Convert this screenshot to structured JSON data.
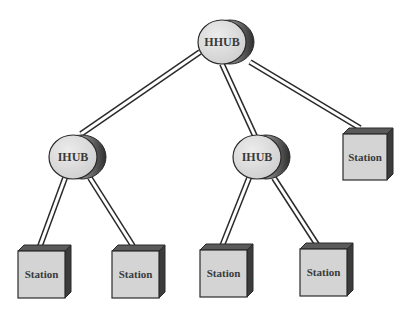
{
  "diagram": {
    "root": {
      "id": "hhub",
      "label": "HHUB",
      "type": "hub",
      "cx": 222,
      "cy": 42
    },
    "hubs": [
      {
        "id": "ihub-left",
        "label": "IHUB",
        "type": "hub",
        "cx": 73,
        "cy": 157
      },
      {
        "id": "ihub-middle",
        "label": "IHUB",
        "type": "hub",
        "cx": 257,
        "cy": 157
      }
    ],
    "stations": [
      {
        "id": "station-right",
        "label": "Station",
        "x": 343,
        "y": 128
      },
      {
        "id": "station-1",
        "label": "Station",
        "x": 18,
        "y": 248
      },
      {
        "id": "station-2",
        "label": "Station",
        "x": 112,
        "y": 248
      },
      {
        "id": "station-3",
        "label": "Station",
        "x": 200,
        "y": 248
      },
      {
        "id": "station-4",
        "label": "Station",
        "x": 300,
        "y": 248
      }
    ],
    "links": [
      {
        "from": "hhub",
        "to": "ihub-left"
      },
      {
        "from": "hhub",
        "to": "ihub-middle"
      },
      {
        "from": "hhub",
        "to": "station-right"
      },
      {
        "from": "ihub-left",
        "to": "station-1"
      },
      {
        "from": "ihub-left",
        "to": "station-2"
      },
      {
        "from": "ihub-middle",
        "to": "station-3"
      },
      {
        "from": "ihub-middle",
        "to": "station-4"
      }
    ],
    "colors": {
      "hub_face": "#d8d8d8",
      "hub_side_dark": "#4a4a4a",
      "station_face": "#d4d4d4",
      "station_top": "#5a5a5a",
      "station_side": "#3c3c3c",
      "outline": "#2a2a2a",
      "text": "#3a3a3a"
    }
  }
}
